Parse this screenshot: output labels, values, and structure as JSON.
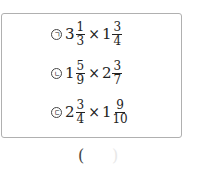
{
  "problems": [
    {
      "marker": "ㄱ",
      "a": {
        "whole": "3",
        "num": "1",
        "den": "3"
      },
      "op": "×",
      "b": {
        "whole": "1",
        "num": "3",
        "den": "4"
      }
    },
    {
      "marker": "ㄴ",
      "a": {
        "whole": "1",
        "num": "5",
        "den": "9"
      },
      "op": "×",
      "b": {
        "whole": "2",
        "num": "3",
        "den": "7"
      }
    },
    {
      "marker": "ㄷ",
      "a": {
        "whole": "2",
        "num": "3",
        "den": "4"
      },
      "op": "×",
      "b": {
        "whole": "1",
        "num": "9",
        "den": "10"
      }
    }
  ],
  "answer": {
    "open": "(",
    "close": ")"
  }
}
